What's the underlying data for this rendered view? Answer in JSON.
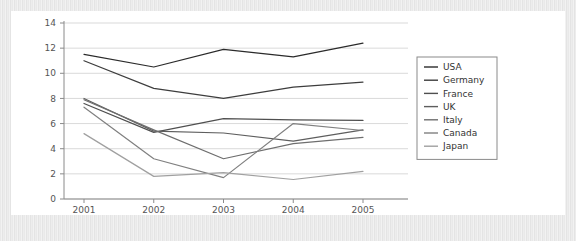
{
  "chart_data": {
    "type": "line",
    "title": "",
    "xlabel": "",
    "ylabel": "",
    "categories": [
      "2001",
      "2002",
      "2003",
      "2004",
      "2005"
    ],
    "x_tick_labels": [
      "2001",
      "2002",
      "2003",
      "2004",
      "2005"
    ],
    "y_tick_labels": [
      "0",
      "2",
      "4",
      "6",
      "8",
      "10",
      "12",
      "14"
    ],
    "y_ticks": [
      0,
      2,
      4,
      6,
      8,
      10,
      12,
      14
    ],
    "ylim": [
      0,
      14
    ],
    "grid": true,
    "legend_position": "right",
    "series": [
      {
        "name": "USA",
        "color": "#2b2b2b",
        "values": [
          11.5,
          10.5,
          11.9,
          11.3,
          12.4
        ]
      },
      {
        "name": "Germany",
        "color": "#3d3d3d",
        "values": [
          11.0,
          8.8,
          8.0,
          8.9,
          9.3
        ]
      },
      {
        "name": "France",
        "color": "#4f4f4f",
        "values": [
          7.6,
          5.3,
          6.4,
          6.3,
          6.25
        ]
      },
      {
        "name": "UK",
        "color": "#5e5e5e",
        "values": [
          8.0,
          5.4,
          5.25,
          4.6,
          5.5
        ]
      },
      {
        "name": "Italy",
        "color": "#6e6e6e",
        "values": [
          7.9,
          5.5,
          3.2,
          4.4,
          4.9
        ]
      },
      {
        "name": "Canada",
        "color": "#808080",
        "values": [
          7.3,
          3.2,
          1.7,
          6.0,
          5.45
        ]
      },
      {
        "name": "Japan",
        "color": "#a0a0a0",
        "values": [
          5.2,
          1.8,
          2.1,
          1.55,
          2.2
        ]
      }
    ]
  },
  "legend": {
    "items": [
      {
        "label": "USA"
      },
      {
        "label": "Germany"
      },
      {
        "label": "France"
      },
      {
        "label": "UK"
      },
      {
        "label": "Italy"
      },
      {
        "label": "Canada"
      },
      {
        "label": "Japan"
      }
    ]
  },
  "colors": {
    "grid": "#c8c8c8",
    "axis": "#8a8a8a",
    "card_background": "#ffffff",
    "frame_background": "#e9e9e9"
  }
}
